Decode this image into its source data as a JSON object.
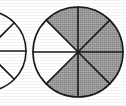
{
  "figure": {
    "background_color": "#ffffff",
    "stroke_color": "#1a1a1a",
    "shaded_color": "#9a9a9a",
    "unshaded_color": "#ffffff",
    "stroke_width": 1.6
  },
  "chart_data": {
    "type": "pie",
    "xlabel": "",
    "ylabel": "",
    "grid": false,
    "legend": "none",
    "charts": [
      {
        "name": "left-circle",
        "label": "Left fraction circle (cropped at left edge of image)",
        "center_x": -14,
        "center_y": 51,
        "radius": 40,
        "total_sectors": 8,
        "shaded_sectors": 2,
        "unshaded_sectors": 6,
        "fraction": "2/8",
        "cropped": true,
        "sectors": [
          {
            "index": 1,
            "start_deg": 0,
            "end_deg": 45,
            "state": "unshaded"
          },
          {
            "index": 2,
            "start_deg": 45,
            "end_deg": 90,
            "state": "unshaded"
          },
          {
            "index": 3,
            "start_deg": 90,
            "end_deg": 135,
            "state": "unshaded"
          },
          {
            "index": 4,
            "start_deg": 135,
            "end_deg": 180,
            "state": "unshaded"
          },
          {
            "index": 5,
            "start_deg": 180,
            "end_deg": 225,
            "state": "unshaded"
          },
          {
            "index": 6,
            "start_deg": 225,
            "end_deg": 270,
            "state": "unshaded"
          },
          {
            "index": 7,
            "start_deg": 270,
            "end_deg": 315,
            "state": "shaded"
          },
          {
            "index": 8,
            "start_deg": 315,
            "end_deg": 360,
            "state": "shaded"
          }
        ]
      },
      {
        "name": "right-circle",
        "label": "Right fraction circle, eight equal sectors",
        "center_x": 78,
        "center_y": 52,
        "radius": 45,
        "total_sectors": 8,
        "shaded_sectors": 6,
        "unshaded_sectors": 2,
        "fraction": "6/8",
        "cropped": false,
        "sectors": [
          {
            "index": 1,
            "start_deg": 0,
            "end_deg": 45,
            "state": "shaded"
          },
          {
            "index": 2,
            "start_deg": 45,
            "end_deg": 90,
            "state": "shaded"
          },
          {
            "index": 3,
            "start_deg": 90,
            "end_deg": 135,
            "state": "shaded"
          },
          {
            "index": 4,
            "start_deg": 135,
            "end_deg": 180,
            "state": "shaded"
          },
          {
            "index": 5,
            "start_deg": 180,
            "end_deg": 225,
            "state": "shaded"
          },
          {
            "index": 6,
            "start_deg": 225,
            "end_deg": 270,
            "state": "unshaded"
          },
          {
            "index": 7,
            "start_deg": 270,
            "end_deg": 315,
            "state": "unshaded"
          },
          {
            "index": 8,
            "start_deg": 315,
            "end_deg": 360,
            "state": "shaded"
          }
        ]
      }
    ]
  }
}
